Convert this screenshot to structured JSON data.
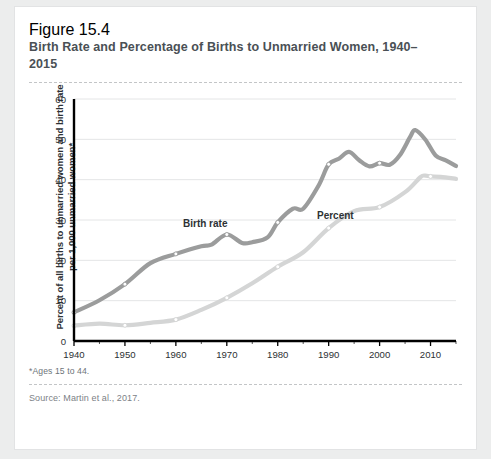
{
  "figure": {
    "label": "Figure 15.4",
    "title": "Birth Rate and Percentage of Births to Unmarried Women, 1940–2015",
    "footnote": "*Ages 15 to 44.",
    "source": "Source: Martin et al., 2017."
  },
  "colors": {
    "birth_rate_line": "#9b9c9c",
    "percent_line": "#d4d5d5",
    "axis": "#000000",
    "gridline": "#e4e5e6",
    "text": "#2d3134",
    "title_text": "#4a5055",
    "card_background": "#ffffff",
    "page_background": "#eceded"
  },
  "chart_data": {
    "type": "line",
    "title": "Birth Rate and Percentage of Births to Unmarried Women, 1940–2015",
    "xlabel": "",
    "ylabel": "Percent of all births to unmarried women and birth rate per 1,000 unmarried women*",
    "xlim": [
      1940,
      2015
    ],
    "ylim": [
      0,
      60
    ],
    "yticks": [
      0,
      10,
      20,
      30,
      40,
      50,
      60
    ],
    "ytick_labels": [
      "0",
      "10",
      "20",
      "30",
      "40",
      "50",
      "60"
    ],
    "xticks": [
      1940,
      1950,
      1960,
      1970,
      1980,
      1990,
      2000,
      2010
    ],
    "xtick_labels": [
      "1940",
      "1950",
      "1960",
      "1970",
      "1980",
      "1990",
      "2000",
      "2010"
    ],
    "grid": true,
    "legend": "inline-labels",
    "markers_at_decades": true,
    "series": [
      {
        "name": "Birth rate",
        "label": "Birth rate",
        "color": "#9b9c9c",
        "x": [
          1940,
          1945,
          1950,
          1955,
          1960,
          1965,
          1967,
          1970,
          1973,
          1975,
          1978,
          1980,
          1983,
          1985,
          1988,
          1990,
          1992,
          1994,
          1996,
          1998,
          2000,
          2002,
          2004,
          2006,
          2007,
          2009,
          2011,
          2013,
          2015
        ],
        "values": [
          7.1,
          10.1,
          14.1,
          19.3,
          21.6,
          23.5,
          23.9,
          26.4,
          24.3,
          24.5,
          25.7,
          29.4,
          32.8,
          32.8,
          38.5,
          43.8,
          45.2,
          46.9,
          44.8,
          43.3,
          44.1,
          43.7,
          46.1,
          50.6,
          52.3,
          49.9,
          46.0,
          44.8,
          43.4
        ]
      },
      {
        "name": "Percent",
        "label": "Percent",
        "color": "#d4d5d5",
        "x": [
          1940,
          1945,
          1950,
          1955,
          1960,
          1965,
          1970,
          1975,
          1980,
          1985,
          1990,
          1995,
          2000,
          2005,
          2008,
          2009,
          2010,
          2012,
          2015
        ],
        "values": [
          3.8,
          4.3,
          3.9,
          4.5,
          5.3,
          7.7,
          10.7,
          14.3,
          18.4,
          22.0,
          28.0,
          32.2,
          33.2,
          36.9,
          40.6,
          41.0,
          40.8,
          40.7,
          40.2
        ]
      }
    ]
  }
}
